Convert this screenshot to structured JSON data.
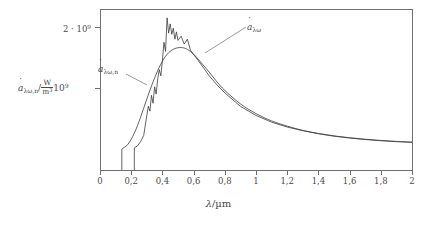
{
  "chart_data": {
    "type": "line",
    "title": "",
    "xlabel": "λ/µm",
    "ylabel": "ȧλω,n / (W/m³)",
    "xlim": [
      0,
      2
    ],
    "ylim": [
      0,
      2400000000.0
    ],
    "grid": false,
    "legend_position": "inline-annotations",
    "xticks": [
      0,
      0.2,
      0.4,
      0.6,
      0.8,
      1,
      1.2,
      1.4,
      1.6,
      1.8,
      2
    ],
    "xticklabels": [
      "0",
      "0,2",
      "0,4",
      "0,6",
      "0,8",
      "1",
      "1,2",
      "1,4",
      "1,6",
      "1,8",
      "2"
    ],
    "yticks": [
      1000000000.0,
      2000000000.0
    ],
    "yticklabels": [
      "10⁹",
      "2 · 10⁹"
    ],
    "series": [
      {
        "name": "ȧλω",
        "description": "extraterrestrial / measured solar spectral irradiance with absorption bands (jagged)",
        "x": [
          0.22,
          0.24,
          0.26,
          0.28,
          0.3,
          0.31,
          0.32,
          0.33,
          0.34,
          0.35,
          0.36,
          0.37,
          0.38,
          0.39,
          0.4,
          0.41,
          0.42,
          0.43,
          0.44,
          0.45,
          0.46,
          0.47,
          0.48,
          0.49,
          0.5,
          0.52,
          0.54,
          0.56,
          0.58,
          0.6,
          0.65,
          0.7,
          0.75,
          0.8,
          0.9,
          1.0,
          1.1,
          1.2,
          1.3,
          1.4,
          1.5,
          1.6,
          1.7,
          1.8,
          1.9,
          2.0
        ],
        "values": [
          20000000.0,
          50000000.0,
          120000000.0,
          220000000.0,
          550000000.0,
          700000000.0,
          620000000.0,
          880000000.0,
          750000000.0,
          1020000000.0,
          900000000.0,
          1150000000.0,
          1300000000.0,
          1200000000.0,
          1450000000.0,
          1750000000.0,
          1600000000.0,
          2150000000.0,
          1900000000.0,
          2050000000.0,
          1880000000.0,
          1980000000.0,
          1800000000.0,
          1920000000.0,
          1780000000.0,
          1850000000.0,
          1720000000.0,
          1800000000.0,
          1620000000.0,
          1550000000.0,
          1380000000.0,
          1200000000.0,
          1050000000.0,
          920000000.0,
          700000000.0,
          550000000.0,
          440000000.0,
          360000000.0,
          300000000.0,
          250000000.0,
          210000000.0,
          180000000.0,
          155000000.0,
          135000000.0,
          120000000.0,
          110000000.0
        ]
      },
      {
        "name": "ȧλω,n",
        "description": "smooth Planck blackbody reference curve",
        "x": [
          0.14,
          0.18,
          0.22,
          0.26,
          0.3,
          0.34,
          0.38,
          0.42,
          0.46,
          0.5,
          0.54,
          0.58,
          0.62,
          0.66,
          0.7,
          0.75,
          0.8,
          0.9,
          1.0,
          1.1,
          1.2,
          1.3,
          1.4,
          1.5,
          1.6,
          1.7,
          1.8,
          1.9,
          2.0
        ],
        "values": [
          0.0,
          80000000.0,
          260000000.0,
          520000000.0,
          820000000.0,
          1100000000.0,
          1340000000.0,
          1520000000.0,
          1620000000.0,
          1660000000.0,
          1655000000.0,
          1600000000.0,
          1500000000.0,
          1380000000.0,
          1260000000.0,
          1100000000.0,
          960000000.0,
          740000000.0,
          580000000.0,
          460000000.0,
          375000000.0,
          305000000.0,
          255000000.0,
          215000000.0,
          185000000.0,
          160000000.0,
          140000000.0,
          125000000.0,
          112000000.0
        ]
      }
    ],
    "annotations": [
      {
        "name": "global-curve-label",
        "text": "ȧλω",
        "leader": true
      },
      {
        "name": "normal-curve-label",
        "text": "ȧλω,n",
        "leader": true
      }
    ]
  },
  "axes": {
    "x": {
      "title_symbol": "λ",
      "title_unit": "µm",
      "ticklabels": [
        "0",
        "0,2",
        "0,4",
        "0,6",
        "0,8",
        "1",
        "1,2",
        "1,4",
        "1,6",
        "1,8",
        "2"
      ]
    },
    "y": {
      "symbol": "a",
      "subscript": "λω,n",
      "unit_numerator": "W",
      "unit_denominator": "m",
      "unit_denominator_exponent": "3",
      "tick_upper_coefficient": "2 · 10",
      "tick_upper_exponent": "9",
      "tick_lower_mantissa": "10",
      "tick_lower_exponent": "9"
    }
  },
  "labels": {
    "curve_global_symbol": "a",
    "curve_global_subscript": "λω",
    "curve_normal_symbol": "a",
    "curve_normal_subscript": "λω,n"
  },
  "colors": {
    "curve": "#3c3c3c",
    "axis": "#6f6f6f",
    "text": "#4a4a4a",
    "background": "#ffffff"
  }
}
